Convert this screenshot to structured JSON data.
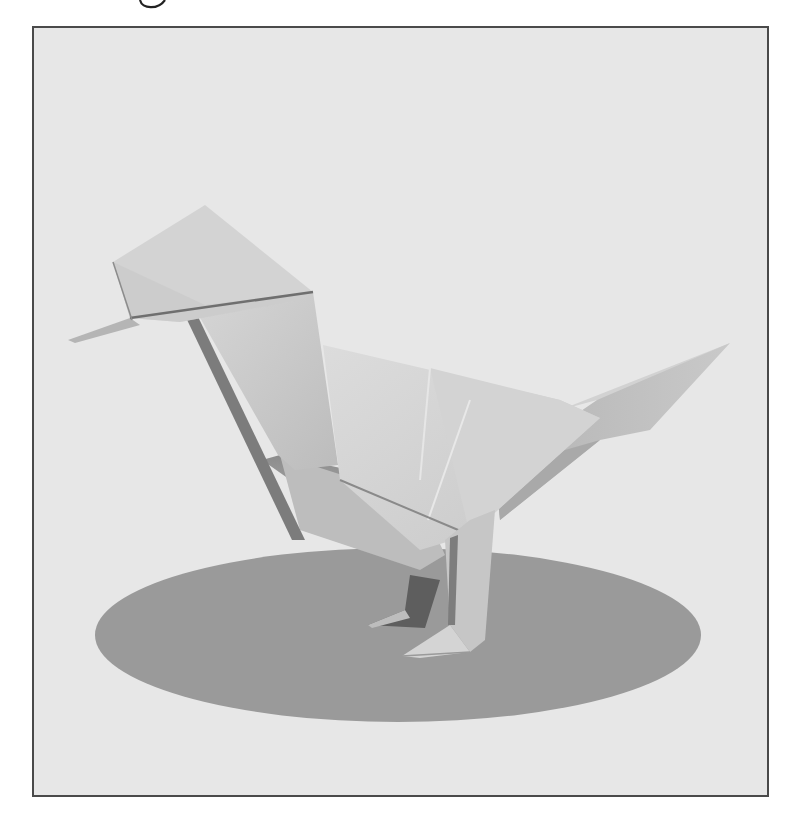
{
  "image": {
    "subject": "origami bird standing on oval shadow",
    "top_fragment": "partial handwritten glyph cut off at top edge",
    "colors": {
      "page_background": "#ffffff",
      "frame_border": "#4a4a4a",
      "frame_fill": "#e7e7e7",
      "shadow_ellipse": "#9a9a9a",
      "paper_light": "#d9d9d9",
      "paper_mid": "#c4c4c4",
      "paper_dark": "#a8a8a8",
      "paper_deep": "#6e6e6e"
    }
  }
}
